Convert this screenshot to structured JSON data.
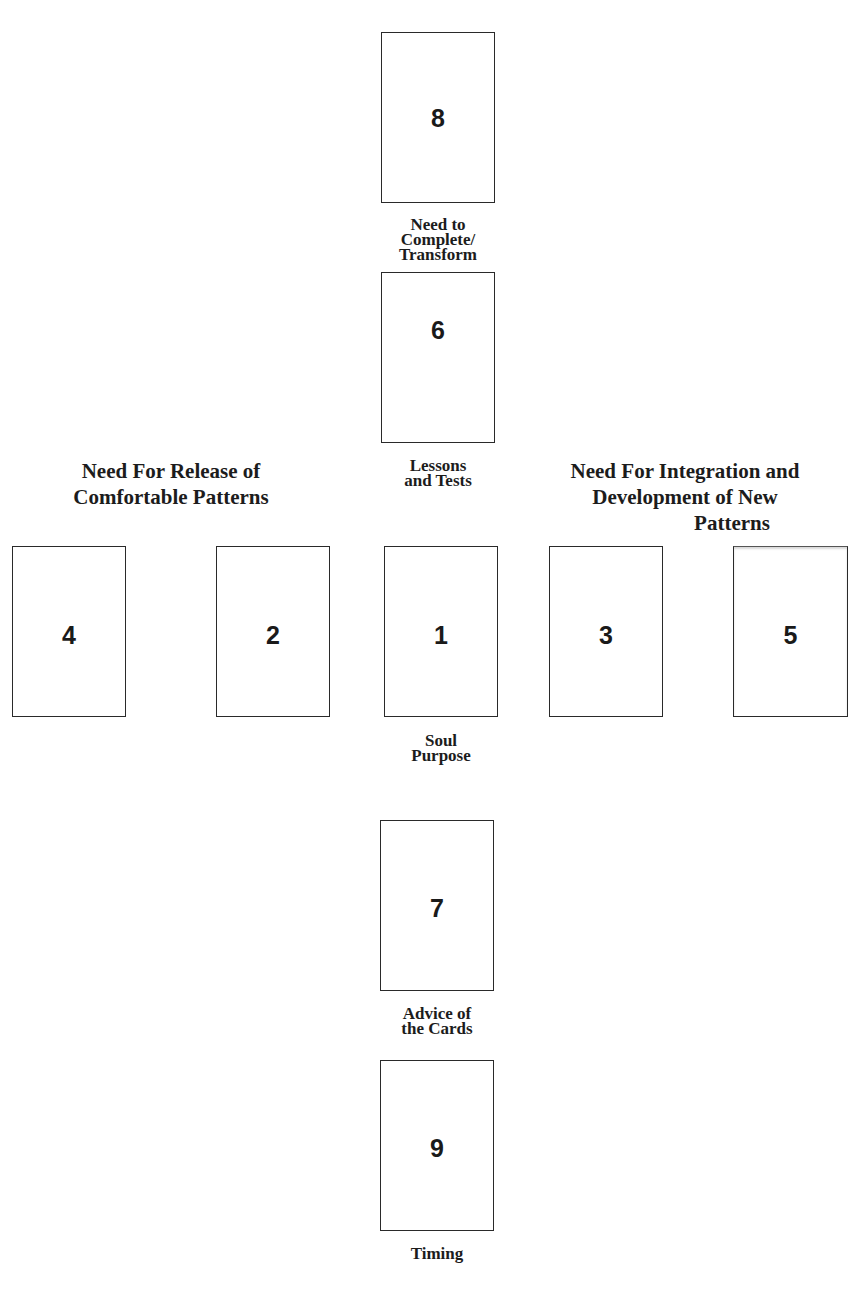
{
  "spread": {
    "title_cropped": "",
    "cards": [
      {
        "position": 8,
        "number": "8",
        "label": "Need to Complete/ Transform"
      },
      {
        "position": 6,
        "number": "6",
        "label": "Lessons and Tests"
      },
      {
        "position": 4,
        "number": "4",
        "label": ""
      },
      {
        "position": 2,
        "number": "2",
        "label": ""
      },
      {
        "position": 1,
        "number": "1",
        "label": "Soul Purpose"
      },
      {
        "position": 3,
        "number": "3",
        "label": ""
      },
      {
        "position": 5,
        "number": "5",
        "label": ""
      },
      {
        "position": 7,
        "number": "7",
        "label": "Advice of the Cards"
      },
      {
        "position": 9,
        "number": "9",
        "label": "Timing"
      }
    ],
    "labels": {
      "card8": [
        "Need to",
        "Complete/",
        "Transform"
      ],
      "card6": [
        "Lessons",
        "and Tests"
      ],
      "card1": [
        "Soul",
        "Purpose"
      ],
      "card7": [
        "Advice of",
        "the Cards"
      ],
      "card9": [
        "Timing"
      ]
    },
    "group_headings": {
      "left": [
        "Need For Release of",
        "Comfortable Patterns"
      ],
      "right": [
        "Need For Integration and",
        "Development of New",
        "Patterns"
      ]
    }
  }
}
